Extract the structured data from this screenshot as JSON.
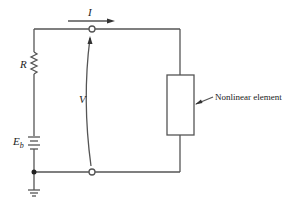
{
  "diagram": {
    "type": "circuit",
    "labels": {
      "current": "I",
      "resistor": "R",
      "voltage": "V",
      "battery": "E",
      "battery_subscript": "b",
      "element": "Nonlinear element"
    },
    "colors": {
      "wire": "#555555",
      "text": "#222222",
      "background": "#ffffff"
    },
    "components": [
      {
        "id": "resistor",
        "label": "R"
      },
      {
        "id": "battery",
        "label": "E_b"
      },
      {
        "id": "nonlinear-element",
        "label": "Nonlinear element"
      },
      {
        "id": "ground"
      },
      {
        "id": "terminal-top"
      },
      {
        "id": "terminal-bottom"
      }
    ]
  }
}
